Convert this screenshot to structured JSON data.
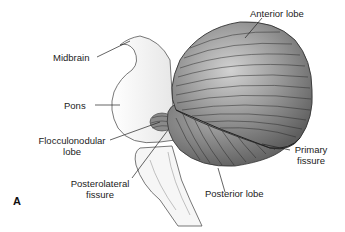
{
  "figure": {
    "panel_label": "A",
    "labels": {
      "midbrain": "Midbrain",
      "pons": "Pons",
      "flocculonodular_line1": "Flocculonodular",
      "flocculonodular_line2": "lobe",
      "posterolateral_line1": "Posterolateral",
      "posterolateral_line2": "fissure",
      "anterior_lobe": "Anterior lobe",
      "primary_line1": "Primary",
      "primary_line2": "fissure",
      "posterior_lobe": "Posterior lobe"
    },
    "colors": {
      "cerebellum_dark": "#6e6e6e",
      "cerebellum_light": "#c8c8c8",
      "brainstem": "#f2f2f2",
      "outline": "#444444"
    }
  }
}
